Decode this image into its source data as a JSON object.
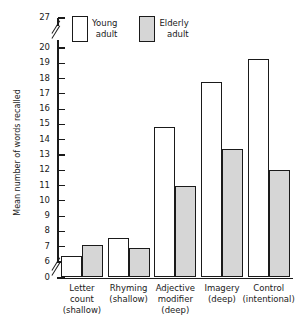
{
  "chart_data": {
    "type": "bar",
    "title": "",
    "xlabel": "",
    "ylabel": "Mean number of words recalled",
    "categories": [
      "Letter count (shallow)",
      "Rhyming (shallow)",
      "Adjective modifier (deep)",
      "Imagery (deep)",
      "Control (intentional)"
    ],
    "category_lines": [
      [
        "Letter",
        "count",
        "(shallow)"
      ],
      [
        "Rhyming",
        "(shallow)"
      ],
      [
        "Adjective",
        "modifier",
        "(deep)"
      ],
      [
        "Imagery",
        "(deep)"
      ],
      [
        "Control",
        "(intentional)"
      ]
    ],
    "series": [
      {
        "name": "Young adult",
        "name_lines": [
          "Young",
          "adult"
        ],
        "color": "#ffffff",
        "values": [
          6.4,
          7.6,
          14.8,
          17.8,
          19.3
        ]
      },
      {
        "name": "Elderly adult",
        "name_lines": [
          "Elderly",
          "adult"
        ],
        "color": "#d6d6d6",
        "values": [
          7.1,
          6.9,
          11.0,
          13.4,
          12.0
        ]
      }
    ],
    "ylim": [
      0,
      27
    ],
    "yticks": [
      0,
      6,
      7,
      8,
      9,
      10,
      11,
      12,
      13,
      14,
      15,
      16,
      17,
      18,
      19,
      20,
      27
    ],
    "ytick_labels": [
      "0",
      "6",
      "7",
      "8",
      "9",
      "10",
      "11",
      "12",
      "13",
      "14",
      "15",
      "16",
      "17",
      "18",
      "19",
      "20",
      "27"
    ],
    "axis_breaks": [
      {
        "between": [
          0,
          6
        ]
      },
      {
        "between": [
          20,
          27
        ]
      }
    ],
    "grid": false,
    "legend_position": "top-left",
    "axis_color": "#1a1a1a"
  }
}
